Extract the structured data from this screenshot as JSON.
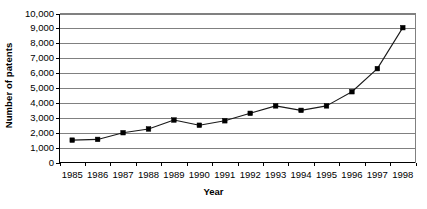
{
  "chart_data": {
    "type": "line",
    "title": "",
    "xlabel": "Year",
    "ylabel": "Number of patents",
    "categories": [
      "1985",
      "1986",
      "1987",
      "1988",
      "1989",
      "1990",
      "1991",
      "1992",
      "1993",
      "1994",
      "1995",
      "1996",
      "1997",
      "1998"
    ],
    "x": [
      1985,
      1986,
      1987,
      1988,
      1989,
      1990,
      1991,
      1992,
      1993,
      1994,
      1995,
      1996,
      1997,
      1998
    ],
    "values": [
      1500,
      1550,
      2000,
      2250,
      2850,
      2500,
      2800,
      3300,
      3800,
      3500,
      3800,
      4750,
      6300,
      9050
    ],
    "ylim": [
      0,
      10000
    ],
    "ytick_values": [
      0,
      1000,
      2000,
      3000,
      4000,
      5000,
      6000,
      7000,
      8000,
      9000,
      10000
    ],
    "ytick_labels": [
      "0",
      "1,000",
      "2,000",
      "3,000",
      "4,000",
      "5,000",
      "6,000",
      "7,000",
      "8,000",
      "9,000",
      "10,000"
    ],
    "grid": "horizontal",
    "legend": "none",
    "marker": "square",
    "series": [
      {
        "name": "Number of patents",
        "values": [
          1500,
          1550,
          2000,
          2250,
          2850,
          2500,
          2800,
          3300,
          3800,
          3500,
          3800,
          4750,
          6300,
          9050
        ]
      }
    ],
    "colors": {
      "line": "#1a1a1a",
      "marker": "#000000",
      "grid": "#808080",
      "axis": "#000000",
      "background": "#ffffff"
    }
  }
}
